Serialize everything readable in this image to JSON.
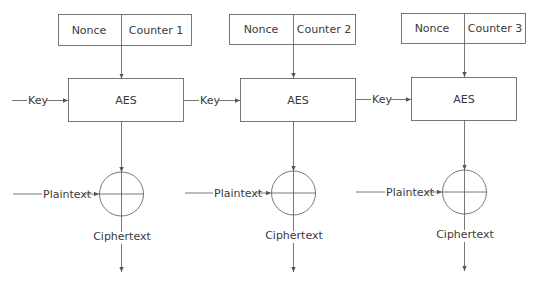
{
  "diagram": {
    "type": "AES-CTR mode encryption",
    "stroke_color": "#555555",
    "blocks": [
      {
        "nonce_label": "Nonce",
        "counter_label": "Counter 1",
        "cipher_label": "AES",
        "key_label": "Key",
        "plaintext_label": "Plaintext",
        "ciphertext_label": "Ciphertext"
      },
      {
        "nonce_label": "Nonce",
        "counter_label": "Counter 2",
        "cipher_label": "AES",
        "key_label": "Key",
        "plaintext_label": "Plaintext",
        "ciphertext_label": "Ciphertext"
      },
      {
        "nonce_label": "Nonce",
        "counter_label": "Counter 3",
        "cipher_label": "AES",
        "key_label": "Key",
        "plaintext_label": "Plaintext",
        "ciphertext_label": "Ciphertext"
      }
    ]
  }
}
